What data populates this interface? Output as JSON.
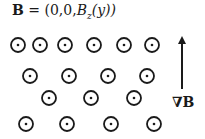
{
  "equation": {
    "vector": "B",
    "equals": " = (0,0,",
    "component": "B",
    "subscript": "z",
    "arg": "(y))"
  },
  "gradient_label": "∇B",
  "field_symbol": "out-of-page (dot in circle)",
  "colors": {
    "stroke": "#1a1a1a",
    "background": "#ffffff"
  },
  "rows": [
    {
      "y": 45,
      "xs": [
        18,
        40,
        65,
        94,
        124,
        152
      ]
    },
    {
      "y": 76,
      "xs": [
        30,
        69,
        108,
        147
      ]
    },
    {
      "y": 98,
      "xs": [
        49,
        91,
        134
      ]
    },
    {
      "y": 124,
      "xs": [
        26,
        67,
        111,
        154
      ]
    }
  ],
  "arrow": {
    "x": 182,
    "y_top": 36,
    "y_bottom": 89
  }
}
